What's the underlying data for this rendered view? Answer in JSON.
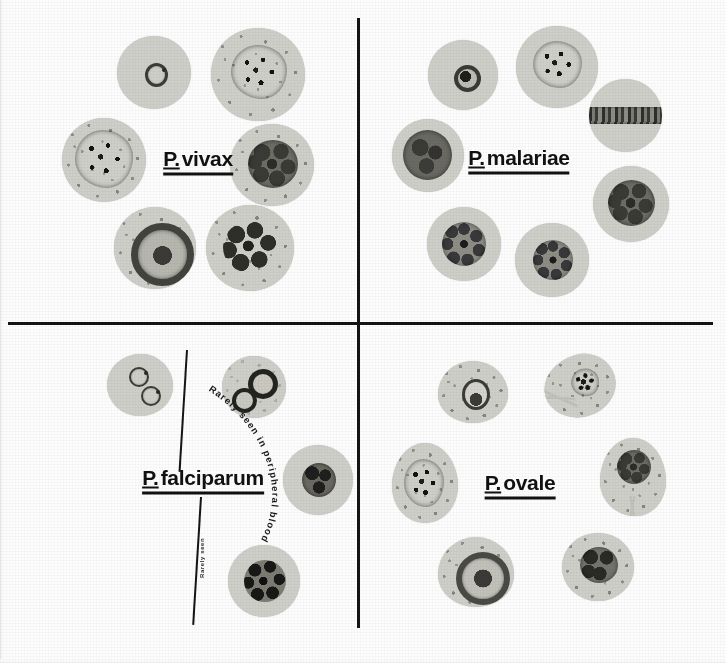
{
  "plate": {
    "title": "Malaria species comparison plate",
    "background_color": "#fdfdfd",
    "divider_color": "#141414",
    "cell_color": "#cfcfca",
    "parasite_color": "#3b3b38"
  },
  "quadrants": [
    {
      "id": "vivax",
      "genus": "P.",
      "epithet": "vivax",
      "label": "P. vivax",
      "position": "top-left",
      "cells": [
        {
          "name": "ring-form-trophozoite",
          "stipple": "none"
        },
        {
          "name": "amoeboid-trophozoite",
          "stipple": "dense"
        },
        {
          "name": "late-amoeboid-trophozoite",
          "stipple": "dense"
        },
        {
          "name": "immature-schizont",
          "stipple": "dense"
        },
        {
          "name": "macrogametocyte",
          "stipple": "dense"
        },
        {
          "name": "mature-schizont-merozoites",
          "stipple": "dense"
        }
      ]
    },
    {
      "id": "malariae",
      "genus": "P.",
      "epithet": "malariae",
      "label": "P. malariae",
      "position": "top-right",
      "cells": [
        {
          "name": "ring-form-trophozoite",
          "stipple": "none"
        },
        {
          "name": "growing-trophozoite",
          "stipple": "none"
        },
        {
          "name": "band-form-trophozoite",
          "stipple": "none"
        },
        {
          "name": "mature-trophozoite",
          "stipple": "none"
        },
        {
          "name": "developing-schizont",
          "stipple": "none"
        },
        {
          "name": "rosette-schizont",
          "stipple": "none"
        },
        {
          "name": "gametocyte",
          "stipple": "none"
        }
      ]
    },
    {
      "id": "falciparum",
      "genus": "P.",
      "epithet": "falciparum",
      "label": "P. falciparum",
      "position": "bottom-left",
      "annotation": "Rarely seen in peripheral blood",
      "annotation_small": "Rarely seen",
      "cells": [
        {
          "name": "double-ring-form-trophozoite",
          "stipple": "none"
        },
        {
          "name": "multiple-ring-forms-maurer",
          "stipple": "light"
        },
        {
          "name": "crescent-gametocyte",
          "stipple": "none"
        },
        {
          "name": "banana-gametocyte",
          "stipple": "none"
        },
        {
          "name": "mature-trophozoite",
          "stipple": "none"
        },
        {
          "name": "mature-schizont",
          "stipple": "none"
        }
      ]
    },
    {
      "id": "ovale",
      "genus": "P.",
      "epithet": "ovale",
      "label": "P. ovale",
      "position": "bottom-right",
      "cells": [
        {
          "name": "ring-form-trophozoite",
          "stipple": "dense"
        },
        {
          "name": "fimbriated-trophozoite",
          "stipple": "dense"
        },
        {
          "name": "amoeboid-trophozoite-oval",
          "stipple": "dense"
        },
        {
          "name": "fimbriated-schizont",
          "stipple": "dense"
        },
        {
          "name": "mature-schizont",
          "stipple": "dense"
        },
        {
          "name": "gametocyte",
          "stipple": "dense"
        }
      ]
    }
  ]
}
